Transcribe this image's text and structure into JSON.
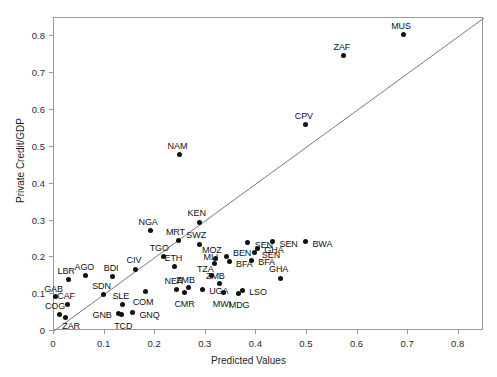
{
  "chart_data": {
    "type": "scatter",
    "title": "",
    "xlabel": "Predicted Values",
    "ylabel": "Private Credit/GDP",
    "xlim": [
      0,
      0.85
    ],
    "ylim": [
      0,
      0.85
    ],
    "xticks": [
      "0",
      "0.1",
      "0.2",
      "0.3",
      "0.4",
      "0.5",
      "0.6",
      "0.7",
      "0.8"
    ],
    "xtick_values": [
      0,
      0.1,
      0.2,
      0.3,
      0.4,
      0.5,
      0.6,
      0.7,
      0.8
    ],
    "yticks": [
      "0",
      "0.1",
      "0.2",
      "0.3",
      "0.4",
      "0.5",
      "0.6",
      "0.7",
      "0.8"
    ],
    "ytick_values": [
      0,
      0.1,
      0.2,
      0.3,
      0.4,
      0.5,
      0.6,
      0.7,
      0.8
    ],
    "grid": false,
    "legend": "none",
    "reference_line": {
      "type": "identity",
      "label": "45-degree line",
      "from": [
        0,
        0
      ],
      "to": [
        0.85,
        0.85
      ]
    },
    "point_color": "#111111",
    "marker": "filled-circle",
    "points": [
      {
        "label": "GAB",
        "x": 0.003,
        "y": 0.093,
        "lx": -2,
        "ly": -8,
        "align": "center"
      },
      {
        "label": "COG",
        "x": 0.01,
        "y": 0.045,
        "lx": -4,
        "ly": -8,
        "align": "center"
      },
      {
        "label": "ZAR",
        "x": 0.022,
        "y": 0.038,
        "lx": 6,
        "ly": 9,
        "align": "center"
      },
      {
        "label": "CAF",
        "x": 0.026,
        "y": 0.072,
        "lx": -1,
        "ly": -8,
        "align": "center"
      },
      {
        "label": "LBR",
        "x": 0.028,
        "y": 0.14,
        "lx": -2,
        "ly": -8,
        "align": "center"
      },
      {
        "label": "AGO",
        "x": 0.062,
        "y": 0.15,
        "lx": -1,
        "ly": -9,
        "align": "center"
      },
      {
        "label": "SDN",
        "x": 0.098,
        "y": 0.1,
        "lx": -2,
        "ly": -8,
        "align": "center"
      },
      {
        "label": "BDI",
        "x": 0.115,
        "y": 0.148,
        "lx": -1,
        "ly": -9,
        "align": "center"
      },
      {
        "label": "GNB",
        "x": 0.128,
        "y": 0.048,
        "lx": -7,
        "ly": 2,
        "align": "left"
      },
      {
        "label": "TCD",
        "x": 0.133,
        "y": 0.046,
        "lx": 2,
        "ly": 12,
        "align": "center"
      },
      {
        "label": "SLE",
        "x": 0.136,
        "y": 0.072,
        "lx": -2,
        "ly": -8,
        "align": "center"
      },
      {
        "label": "GNQ",
        "x": 0.155,
        "y": 0.05,
        "lx": 7,
        "ly": 2,
        "align": "right"
      },
      {
        "label": "CIV",
        "x": 0.162,
        "y": 0.168,
        "lx": -2,
        "ly": -9,
        "align": "center"
      },
      {
        "label": "COM",
        "x": 0.18,
        "y": 0.108,
        "lx": -2,
        "ly": 11,
        "align": "center"
      },
      {
        "label": "NGA",
        "x": 0.19,
        "y": 0.272,
        "lx": -2,
        "ly": -9,
        "align": "center"
      },
      {
        "label": "TGO",
        "x": 0.216,
        "y": 0.203,
        "lx": -4,
        "ly": -8,
        "align": "center"
      },
      {
        "label": "ETH",
        "x": 0.238,
        "y": 0.174,
        "lx": -1,
        "ly": -9,
        "align": "center"
      },
      {
        "label": "NER",
        "x": 0.243,
        "y": 0.113,
        "lx": -3,
        "ly": -8,
        "align": "center"
      },
      {
        "label": "MRT",
        "x": 0.246,
        "y": 0.246,
        "lx": -3,
        "ly": -8,
        "align": "center"
      },
      {
        "label": "NAM",
        "x": 0.248,
        "y": 0.478,
        "lx": -2,
        "ly": -9,
        "align": "center"
      },
      {
        "label": "CMR",
        "x": 0.258,
        "y": 0.105,
        "lx": 0,
        "ly": 12,
        "align": "center"
      },
      {
        "label": "ZMB",
        "x": 0.266,
        "y": 0.118,
        "lx": -3,
        "ly": -8,
        "align": "center"
      },
      {
        "label": "SWZ",
        "x": 0.287,
        "y": 0.236,
        "lx": -3,
        "ly": -9,
        "align": "center"
      },
      {
        "label": "KEN",
        "x": 0.288,
        "y": 0.295,
        "lx": -3,
        "ly": -9,
        "align": "center"
      },
      {
        "label": "UGA",
        "x": 0.293,
        "y": 0.113,
        "lx": 7,
        "ly": 2,
        "align": "right"
      },
      {
        "label": "TZA",
        "x": 0.311,
        "y": 0.15,
        "lx": -6,
        "ly": -7,
        "align": "center"
      },
      {
        "label": "MLI",
        "x": 0.318,
        "y": 0.183,
        "lx": -4,
        "ly": -7,
        "align": "center"
      },
      {
        "label": "MOZ",
        "x": 0.32,
        "y": 0.198,
        "lx": -4,
        "ly": -8,
        "align": "center"
      },
      {
        "label": "ZMB",
        "x": 0.327,
        "y": 0.128,
        "lx": -4,
        "ly": -8,
        "align": "center"
      },
      {
        "label": "MWI",
        "x": 0.336,
        "y": 0.105,
        "lx": -2,
        "ly": 12,
        "align": "center"
      },
      {
        "label": "BEN",
        "x": 0.34,
        "y": 0.203,
        "lx": 7,
        "ly": -3,
        "align": "right"
      },
      {
        "label": "BFA",
        "x": 0.346,
        "y": 0.188,
        "lx": 7,
        "ly": 2,
        "align": "right"
      },
      {
        "label": "MDG",
        "x": 0.364,
        "y": 0.103,
        "lx": 1,
        "ly": 12,
        "align": "center"
      },
      {
        "label": "LSO",
        "x": 0.372,
        "y": 0.11,
        "lx": 7,
        "ly": 2,
        "align": "right"
      },
      {
        "label": "SEN",
        "x": 0.383,
        "y": 0.24,
        "lx": 7,
        "ly": 2,
        "align": "right"
      },
      {
        "label": "BFA",
        "x": 0.39,
        "y": 0.192,
        "lx": 7,
        "ly": 2,
        "align": "right"
      },
      {
        "label": "SEN",
        "x": 0.397,
        "y": 0.212,
        "lx": 7,
        "ly": 2,
        "align": "right"
      },
      {
        "label": "GHA",
        "x": 0.402,
        "y": 0.225,
        "lx": 7,
        "ly": 2,
        "align": "right"
      },
      {
        "label": "SEN",
        "x": 0.432,
        "y": 0.243,
        "lx": 7,
        "ly": 2,
        "align": "right"
      },
      {
        "label": "GHA",
        "x": 0.448,
        "y": 0.143,
        "lx": -2,
        "ly": -9,
        "align": "center"
      },
      {
        "label": "BWA",
        "x": 0.497,
        "y": 0.243,
        "lx": 7,
        "ly": 2,
        "align": "right"
      },
      {
        "label": "CPV",
        "x": 0.498,
        "y": 0.56,
        "lx": -2,
        "ly": -9,
        "align": "center"
      },
      {
        "label": "ZAF",
        "x": 0.573,
        "y": 0.748,
        "lx": -2,
        "ly": -9,
        "align": "center"
      },
      {
        "label": "MUS",
        "x": 0.69,
        "y": 0.805,
        "lx": -2,
        "ly": -9,
        "align": "center"
      }
    ]
  },
  "axes": {
    "x_title": "Predicted Values",
    "y_title": "Private Credit/GDP"
  }
}
